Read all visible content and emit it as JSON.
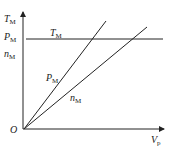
{
  "diagram": {
    "axes": {
      "origin_label": "O",
      "x_label": "V",
      "x_label_sub": "p",
      "y_labels": [
        {
          "main": "T",
          "sub": "M"
        },
        {
          "main": "P",
          "sub": "M"
        },
        {
          "main": "n",
          "sub": "M"
        }
      ]
    },
    "curves": [
      {
        "name": "T_M",
        "main": "T",
        "sub": "M",
        "shape": "horizontal"
      },
      {
        "name": "P_M",
        "main": "P",
        "sub": "M",
        "shape": "steeper-line"
      },
      {
        "name": "n_M",
        "main": "n",
        "sub": "M",
        "shape": "shallower-line"
      }
    ],
    "colors": {
      "line": "#222222",
      "background": "#ffffff"
    }
  }
}
